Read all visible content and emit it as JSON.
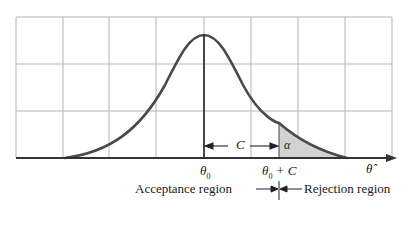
{
  "diagram": {
    "type": "hypothesis-test-normal-curve",
    "labels": {
      "c_distance": "C",
      "alpha": "α",
      "theta0": "θ",
      "theta0_sub": "0",
      "theta0_plus_c_theta": "θ",
      "theta0_plus_c_sub": "0",
      "theta0_plus_c_rest": "+ C",
      "theta_hat": "θ̂",
      "acceptance_region": "Acceptance region",
      "rejection_region": "Rejection region"
    },
    "colors": {
      "curve": "#4a4a4a",
      "grid": "#b5b5b5",
      "axis": "#333333",
      "shaded": "#d2d2d2"
    }
  }
}
